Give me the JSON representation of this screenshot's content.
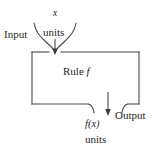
{
  "diagram": {
    "type": "function-machine-flow-diagram",
    "title": "",
    "labels": {
      "input": "Input",
      "input_variable": "x",
      "input_units": "units",
      "rule_text": "Rule",
      "rule_function": "f",
      "output_value": "f(x)",
      "output_units": "units",
      "output": "Output"
    },
    "nodes": [
      {
        "id": "input-brace",
        "name": "input-brace",
        "text": "x units",
        "position": "top-center"
      },
      {
        "id": "input-label",
        "name": "input-label",
        "text": "Input",
        "position": "top-left"
      },
      {
        "id": "rule-box",
        "name": "rule-box",
        "text": "Rule f",
        "position": "center"
      },
      {
        "id": "output-brace",
        "name": "output-brace",
        "text": "f(x) units",
        "position": "bottom-center"
      },
      {
        "id": "output-label",
        "name": "output-label",
        "text": "Output",
        "position": "bottom-right"
      }
    ],
    "arrows": [
      {
        "id": "input-arrow",
        "from": "input-brace",
        "to": "rule-box",
        "direction": "down"
      },
      {
        "id": "output-arrow",
        "from": "rule-box",
        "to": "output-brace",
        "direction": "down"
      }
    ],
    "colors": {
      "background": "#ffffff",
      "stroke": "#4a4a4a",
      "text": "#262626"
    }
  }
}
